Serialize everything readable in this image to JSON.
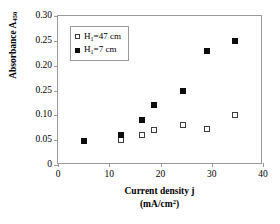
{
  "chart_data": {
    "type": "scatter",
    "title": "",
    "xlabel": "Current density j (mA/cm2)",
    "xlabel_line1": "Current density j",
    "xlabel_line2_prefix": "(mA/cm",
    "xlabel_line2_sup": "2",
    "xlabel_line2_suffix": ")",
    "ylabel_prefix": "Absorbance  A",
    "ylabel_sub": "450",
    "xlim": [
      0,
      40
    ],
    "ylim": [
      0,
      0.3
    ],
    "xticks": [
      0,
      10,
      20,
      30,
      40
    ],
    "xticklabels": [
      "0",
      "10",
      "20",
      "30",
      "40"
    ],
    "yticks": [
      0,
      0.05,
      0.1,
      0.15,
      0.2,
      0.25,
      0.3
    ],
    "yticklabels": [
      "0",
      "0.05",
      "0.10",
      "0.25",
      "0.20",
      "0.25",
      "0.30"
    ],
    "grid": false,
    "legend_position": "upper-left",
    "series": [
      {
        "name": "H1=47 cm",
        "marker": "open-square",
        "color": "#ffffff",
        "edge_color": "#3c3c3c",
        "x": [
          12.3,
          16.3,
          18.8,
          24.3,
          29.1,
          34.6
        ],
        "y": [
          0.05,
          0.06,
          0.07,
          0.08,
          0.073,
          0.1
        ]
      },
      {
        "name": "H1=7 cm",
        "marker": "filled-square",
        "color": "#0d0d0d",
        "edge_color": "#0d0d0d",
        "x": [
          5.1,
          12.3,
          16.3,
          18.8,
          24.3,
          29.1,
          34.6
        ],
        "y": [
          0.049,
          0.06,
          0.09,
          0.12,
          0.15,
          0.23,
          0.25
        ]
      }
    ]
  },
  "legend": {
    "entries": [
      {
        "label_prefix": "H",
        "label_sub": "1",
        "label_suffix": "=47 cm",
        "marker": "open-square"
      },
      {
        "label_prefix": "H",
        "label_sub": "1",
        "label_suffix": "=7 cm",
        "marker": "filled-square"
      }
    ]
  },
  "colors": {
    "axis": "#9a9a9a",
    "text": "#000000",
    "series_filled": "#0d0d0d",
    "series_open_edge": "#3c3c3c",
    "background": "#ffffff"
  }
}
